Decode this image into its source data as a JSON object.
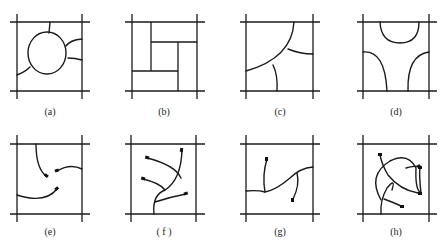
{
  "figure": {
    "panels": [
      {
        "id": "a",
        "label": "(a)"
      },
      {
        "id": "b",
        "label": "(b)"
      },
      {
        "id": "c",
        "label": "(c)"
      },
      {
        "id": "d",
        "label": "(d)"
      },
      {
        "id": "e",
        "label": "(e)"
      },
      {
        "id": "f",
        "label": "( f )"
      },
      {
        "id": "g",
        "label": "(g)"
      },
      {
        "id": "h",
        "label": "(h)"
      }
    ],
    "colors": {
      "stroke": "#1a1a1a",
      "background": "#ffffff"
    }
  }
}
